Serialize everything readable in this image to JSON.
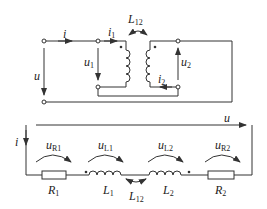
{
  "diagram": {
    "type": "circuit",
    "top_circuit": {
      "labels": {
        "i": "i",
        "i1": "i",
        "i1_sub": "1",
        "i2": "i",
        "i2_sub": "2",
        "u": "u",
        "u1": "u",
        "u1_sub": "1",
        "u2": "u",
        "u2_sub": "2",
        "L12": "L",
        "L12_sub": "12"
      }
    },
    "bottom_circuit": {
      "labels": {
        "u": "u",
        "i": "i",
        "uR1": "u",
        "uR1_sub": "R1",
        "uL1": "u",
        "uL1_sub": "L1",
        "uL2": "u",
        "uL2_sub": "L2",
        "uR2": "u",
        "uR2_sub": "R2",
        "R1": "R",
        "R1_sub": "1",
        "L1": "L",
        "L1_sub": "1",
        "L12": "L",
        "L12_sub": "12",
        "L2": "L",
        "L2_sub": "2",
        "R2": "R",
        "R2_sub": "2"
      }
    },
    "colors": {
      "line": "#333333",
      "background": "#ffffff"
    }
  }
}
